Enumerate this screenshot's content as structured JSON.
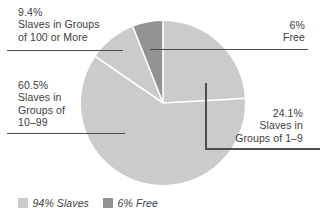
{
  "chart_data": {
    "type": "pie",
    "title": "",
    "start_angle_deg": 0,
    "direction": "clockwise",
    "separator_color": "#ffffff",
    "slices": [
      {
        "id": "groups-1-9",
        "label": "Slaves in Groups of 1–9",
        "pct": 24.1,
        "color": "#cbcbcb"
      },
      {
        "id": "groups-10-99",
        "label": "Slaves in Groups of 10–99",
        "pct": 60.5,
        "color": "#cbcbcb"
      },
      {
        "id": "groups-100-or-more",
        "label": "Slaves in Groups of 100 or More",
        "pct": 9.4,
        "color": "#cbcbcb"
      },
      {
        "id": "free",
        "label": "Free",
        "pct": 6.0,
        "color": "#939393"
      }
    ],
    "legend_position": "bottom-left",
    "legend": [
      {
        "id": "slaves",
        "label": "94% Slaves",
        "color": "#cbcbcb"
      },
      {
        "id": "free",
        "label": "6% Free",
        "color": "#939393"
      }
    ]
  },
  "callouts": {
    "groups_100_or_more": {
      "lines": [
        "9.4%",
        "Slaves in Groups",
        "of 100 or More"
      ]
    },
    "free": {
      "lines": [
        "6%",
        "Free"
      ]
    },
    "groups_10_99": {
      "lines": [
        "60.5%",
        "Slaves in",
        "Groups of",
        "10–99"
      ]
    },
    "groups_1_9": {
      "lines": [
        "24.1%",
        "Slaves in",
        "Groups of 1–9"
      ]
    }
  }
}
